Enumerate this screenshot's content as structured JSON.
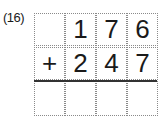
{
  "problem_number": "(16)",
  "grid": {
    "rows": [
      [
        "",
        "1",
        "7",
        "6"
      ],
      [
        "+",
        "2",
        "4",
        "7"
      ],
      [
        "",
        "",
        "",
        ""
      ]
    ]
  }
}
